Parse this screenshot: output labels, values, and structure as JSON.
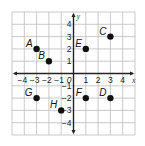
{
  "chart_data": {
    "type": "scatter",
    "title": "",
    "xlabel": "x",
    "ylabel": "y",
    "xlim": [
      -5,
      5
    ],
    "ylim": [
      -5,
      5
    ],
    "grid": true,
    "x_ticks": [
      -4,
      -3,
      -2,
      -1,
      1,
      2,
      3,
      4
    ],
    "y_ticks": [
      4,
      3,
      2,
      1,
      -1,
      -2,
      -3,
      -4
    ],
    "origin_label": "0",
    "points": [
      {
        "label": "A",
        "x": -3,
        "y": 2
      },
      {
        "label": "B",
        "x": -2,
        "y": 1
      },
      {
        "label": "C",
        "x": 3,
        "y": 3
      },
      {
        "label": "D",
        "x": 3,
        "y": -2
      },
      {
        "label": "E",
        "x": 1,
        "y": 2
      },
      {
        "label": "F",
        "x": 1,
        "y": -2
      },
      {
        "label": "G",
        "x": -3,
        "y": -2
      },
      {
        "label": "H",
        "x": -1,
        "y": -3
      }
    ]
  },
  "colors": {
    "grid": "#bdbdbd",
    "axis": "#222222",
    "point": "#111111"
  }
}
